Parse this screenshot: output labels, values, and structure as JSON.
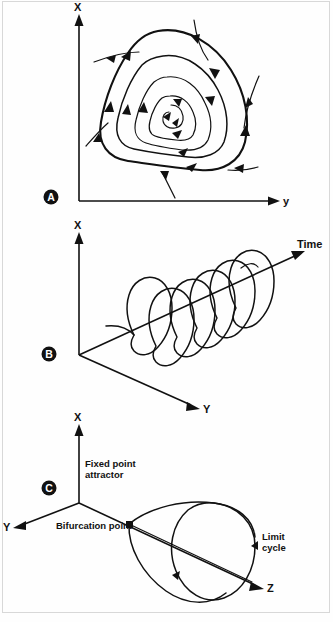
{
  "figure": {
    "background_color": "#fefefe",
    "line_color": "#111111",
    "border_color": "#d8d8d8",
    "caption": ""
  },
  "panels": [
    {
      "letter": "A",
      "name": "phase-portrait",
      "axes": [
        {
          "label": "X",
          "direction": "up"
        },
        {
          "label": "y",
          "direction": "right"
        }
      ],
      "description": "Two dimensional phase plane with nested closed orbits spiralling outward onto a limit cycle; external trajectories spiral inward toward the cycle.",
      "annotations": []
    },
    {
      "letter": "B",
      "name": "time-evolution",
      "axes": [
        {
          "label": "X",
          "direction": "up"
        },
        {
          "label": "Y",
          "direction": "down-right"
        },
        {
          "label": "Time",
          "direction": "up-right"
        }
      ],
      "description": "Three dimensional helical trajectory of the limit cycle unrolled along the Time axis.",
      "annotations": []
    },
    {
      "letter": "C",
      "name": "hopf-bifurcation",
      "axes": [
        {
          "label": "X",
          "direction": "up"
        },
        {
          "label": "Y",
          "direction": "down-left"
        },
        {
          "label": "Z",
          "direction": "down-right"
        }
      ],
      "description": "Hopf bifurcation: a fixed point attractor loses stability at the bifurcation point and a cone of growing limit cycles emerges along Z.",
      "annotations": [
        {
          "text": "Fixed point attractor",
          "lines": [
            "Fixed point",
            "attractor"
          ]
        },
        {
          "text": "Bifurcation point",
          "lines": [
            "Bifurcation point"
          ]
        },
        {
          "text": "Limit cycle",
          "lines": [
            "Limit",
            "cycle"
          ]
        }
      ]
    }
  ],
  "labels": {
    "panel_a_letter": "A",
    "panel_b_letter": "B",
    "panel_c_letter": "C",
    "a_axis_x": "X",
    "a_axis_y": "y",
    "b_axis_x": "X",
    "b_axis_y": "Y",
    "b_axis_time": "Time",
    "c_axis_x": "X",
    "c_axis_y": "Y",
    "c_axis_z": "Z",
    "c_fixed_point_line1": "Fixed point",
    "c_fixed_point_line2": "attractor",
    "c_bifurcation_point": "Bifurcation point",
    "c_limit_cycle_line1": "Limit",
    "c_limit_cycle_line2": "cycle"
  }
}
